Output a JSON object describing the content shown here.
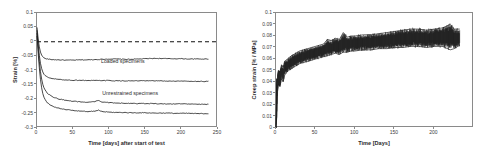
{
  "figure": {
    "background": "#ffffff",
    "line_color": "#1a1a1a",
    "axis_color": "#8a8a8a"
  },
  "chart_data": [
    {
      "id": "left",
      "type": "line",
      "title": "",
      "xlabel": "Time [days] after start of test",
      "ylabel": "Strain [%]",
      "xlim": [
        0,
        250
      ],
      "ylim": [
        -0.3,
        0.1
      ],
      "xticks": [
        0,
        50,
        100,
        150,
        200,
        250
      ],
      "xtick_labels": [
        "0",
        "50",
        "100",
        "150",
        "200",
        "250"
      ],
      "yticks": [
        -0.3,
        -0.25,
        -0.2,
        -0.15,
        -0.1,
        -0.05,
        0,
        0.05,
        0.1
      ],
      "ytick_labels": [
        "-0.3",
        "-0.25",
        "-0.2",
        "-0.15",
        "-0.1",
        "-0.05",
        "0",
        "0.05",
        "0.1"
      ],
      "grid": false,
      "legend": "none",
      "reference_lines": [
        {
          "name": "zero-line",
          "y": 0,
          "style": "dashed"
        }
      ],
      "annotations": [
        {
          "name": "loaded-specimens-label",
          "text": "Loaded specimens",
          "x": 120,
          "y": -0.075
        },
        {
          "name": "unrestrained-specimens-label",
          "text": "Unrestrained specimens",
          "x": 130,
          "y": -0.185
        }
      ],
      "series": [
        {
          "name": "Loaded specimen 1",
          "x": [
            0,
            2,
            4,
            6,
            8,
            10,
            14,
            20,
            30,
            40,
            50,
            60,
            70,
            80,
            90,
            100,
            110,
            120,
            130,
            140,
            150,
            160,
            170,
            180,
            190,
            200,
            210,
            220,
            230,
            237
          ],
          "values": [
            0.05,
            0.0,
            -0.03,
            -0.045,
            -0.052,
            -0.057,
            -0.06,
            -0.062,
            -0.063,
            -0.064,
            -0.064,
            -0.063,
            -0.063,
            -0.062,
            -0.061,
            -0.06,
            -0.06,
            -0.061,
            -0.061,
            -0.06,
            -0.059,
            -0.058,
            -0.058,
            -0.059,
            -0.059,
            -0.059,
            -0.06,
            -0.06,
            -0.06,
            -0.06
          ]
        },
        {
          "name": "Loaded specimen 2",
          "x": [
            0,
            2,
            4,
            6,
            8,
            10,
            14,
            20,
            30,
            40,
            50,
            60,
            70,
            80,
            90,
            100,
            110,
            120,
            130,
            140,
            150,
            160,
            170,
            180,
            190,
            200,
            210,
            220,
            230,
            237
          ],
          "values": [
            0.04,
            -0.02,
            -0.065,
            -0.09,
            -0.105,
            -0.115,
            -0.123,
            -0.128,
            -0.131,
            -0.133,
            -0.134,
            -0.134,
            -0.135,
            -0.135,
            -0.135,
            -0.135,
            -0.136,
            -0.136,
            -0.136,
            -0.136,
            -0.136,
            -0.136,
            -0.136,
            -0.137,
            -0.137,
            -0.137,
            -0.137,
            -0.138,
            -0.138,
            -0.138
          ]
        },
        {
          "name": "Unrestrained specimen 1",
          "x": [
            0,
            2,
            4,
            6,
            8,
            10,
            14,
            20,
            30,
            40,
            50,
            60,
            70,
            80,
            85,
            90,
            100,
            110,
            120,
            130,
            140,
            150,
            160,
            170,
            180,
            190,
            200,
            210,
            220,
            230,
            237
          ],
          "values": [
            0.03,
            -0.035,
            -0.09,
            -0.125,
            -0.148,
            -0.163,
            -0.178,
            -0.19,
            -0.199,
            -0.204,
            -0.207,
            -0.209,
            -0.211,
            -0.208,
            -0.204,
            -0.21,
            -0.212,
            -0.213,
            -0.214,
            -0.214,
            -0.215,
            -0.215,
            -0.215,
            -0.216,
            -0.216,
            -0.216,
            -0.216,
            -0.217,
            -0.217,
            -0.218,
            -0.218
          ]
        },
        {
          "name": "Unrestrained specimen 2",
          "x": [
            0,
            2,
            4,
            6,
            8,
            10,
            14,
            20,
            30,
            40,
            50,
            60,
            70,
            80,
            85,
            90,
            100,
            110,
            120,
            130,
            140,
            150,
            160,
            170,
            180,
            190,
            200,
            210,
            220,
            230,
            237
          ],
          "values": [
            0.02,
            -0.055,
            -0.115,
            -0.155,
            -0.18,
            -0.196,
            -0.212,
            -0.223,
            -0.231,
            -0.236,
            -0.239,
            -0.241,
            -0.243,
            -0.241,
            -0.238,
            -0.243,
            -0.245,
            -0.246,
            -0.246,
            -0.247,
            -0.247,
            -0.247,
            -0.248,
            -0.248,
            -0.248,
            -0.249,
            -0.249,
            -0.249,
            -0.25,
            -0.25,
            -0.25
          ]
        }
      ]
    },
    {
      "id": "right",
      "type": "line",
      "title": "",
      "xlabel": "Time [Days]",
      "ylabel": "Creep strain [% / MPa]",
      "xlim": [
        0,
        250
      ],
      "ylim": [
        0,
        0.1
      ],
      "xticks": [
        0,
        50,
        100,
        150,
        200
      ],
      "xtick_labels": [
        "0",
        "50",
        "100",
        "150",
        "200"
      ],
      "yticks": [
        0,
        0.01,
        0.02,
        0.03,
        0.04,
        0.05,
        0.06,
        0.07,
        0.08,
        0.09,
        0.1
      ],
      "ytick_labels": [
        "0",
        "0.01",
        "0.02",
        "0.03",
        "0.04",
        "0.05",
        "0.06",
        "0.07",
        "0.08",
        "0.09",
        "0.1"
      ],
      "grid": false,
      "legend": "none",
      "annotations": [],
      "series": [
        {
          "name": "Creep strain upper envelope",
          "x": [
            0,
            1,
            2,
            3,
            5,
            7,
            9,
            11,
            13,
            16,
            20,
            25,
            30,
            35,
            40,
            45,
            50,
            55,
            60,
            65,
            70,
            75,
            80,
            85,
            90,
            95,
            100,
            110,
            120,
            130,
            140,
            150,
            160,
            170,
            180,
            190,
            200,
            210,
            220,
            225,
            232
          ],
          "values": [
            0.0,
            0.03,
            0.046,
            0.05,
            0.049,
            0.055,
            0.053,
            0.058,
            0.059,
            0.061,
            0.063,
            0.065,
            0.067,
            0.068,
            0.069,
            0.07,
            0.071,
            0.072,
            0.073,
            0.077,
            0.076,
            0.078,
            0.077,
            0.083,
            0.079,
            0.08,
            0.08,
            0.081,
            0.081,
            0.082,
            0.083,
            0.084,
            0.085,
            0.086,
            0.086,
            0.085,
            0.086,
            0.087,
            0.09,
            0.086,
            0.086
          ]
        },
        {
          "name": "Creep strain lower envelope",
          "x": [
            0,
            1,
            2,
            3,
            5,
            7,
            9,
            11,
            13,
            16,
            20,
            25,
            30,
            35,
            40,
            45,
            50,
            55,
            60,
            65,
            70,
            75,
            80,
            85,
            90,
            95,
            100,
            110,
            120,
            130,
            140,
            150,
            160,
            170,
            180,
            190,
            200,
            210,
            220,
            225,
            232
          ],
          "values": [
            0.0,
            0.01,
            0.032,
            0.038,
            0.036,
            0.043,
            0.04,
            0.046,
            0.048,
            0.05,
            0.052,
            0.054,
            0.056,
            0.057,
            0.058,
            0.059,
            0.06,
            0.061,
            0.062,
            0.063,
            0.064,
            0.065,
            0.064,
            0.066,
            0.066,
            0.067,
            0.067,
            0.068,
            0.068,
            0.069,
            0.069,
            0.07,
            0.07,
            0.071,
            0.071,
            0.07,
            0.071,
            0.071,
            0.068,
            0.069,
            0.072
          ]
        }
      ]
    }
  ]
}
